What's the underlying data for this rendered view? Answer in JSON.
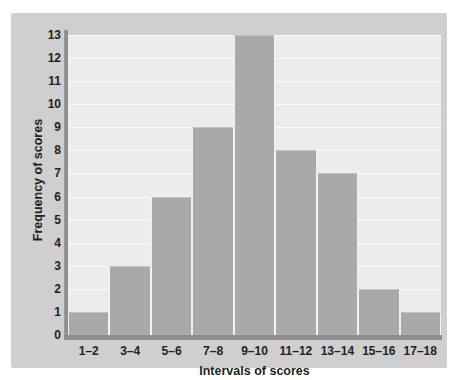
{
  "chart_data": {
    "type": "bar",
    "title": "",
    "subtitle": "",
    "xlabel": "Intervals of scores",
    "ylabel": "Frequency of scores",
    "categories": [
      "1–2",
      "3–4",
      "5–6",
      "7–8",
      "9–10",
      "11–12",
      "13–14",
      "15–16",
      "17–18"
    ],
    "values": [
      1,
      3,
      6,
      9,
      13,
      8,
      7,
      2,
      1
    ],
    "ylim": [
      0,
      13
    ],
    "xlim_categories": 9,
    "y_ticks": [
      "13",
      "12",
      "11",
      "10",
      "9",
      "8",
      "7",
      "6",
      "5",
      "4",
      "3",
      "2",
      "1",
      "0"
    ],
    "y_tick_values": [
      13,
      12,
      11,
      10,
      9,
      8,
      7,
      6,
      5,
      4,
      3,
      2,
      1,
      0
    ],
    "grid": "horizontal",
    "legend": "none",
    "bar_gap": 0,
    "colors": {
      "bar_fill": "#a9a9a9",
      "bar_edge": "#f2f2f2",
      "plot_background": "#ececec",
      "panel_background": "#cfcfcf",
      "page_background": "#ffffff",
      "gridline": "#fbfbfb",
      "axis_line": "#8e8e8e",
      "text": "#231f20"
    }
  }
}
